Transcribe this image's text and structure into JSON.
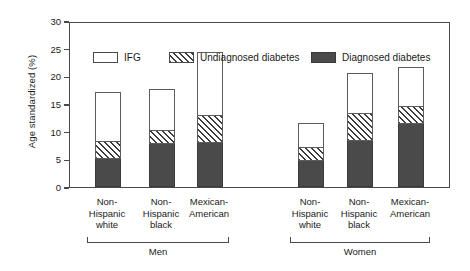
{
  "chart_data": {
    "type": "bar",
    "subtype": "stacked",
    "title": "",
    "xlabel": "",
    "ylabel": "Age standardized (%)",
    "ylim": [
      0,
      30
    ],
    "yticks": [
      0,
      5,
      10,
      15,
      20,
      25,
      30
    ],
    "ytick_labels": [
      "0",
      "5",
      "10",
      "15",
      "20",
      "25",
      "30"
    ],
    "grid": false,
    "legend_position": "top-inside",
    "categories": [
      "Non-\nHispanic\nwhite",
      "Non-\nHispanic\nblack",
      "Mexican-\nAmerican",
      "Non-\nHispanic\nwhite",
      "Non-\nHispanic\nblack",
      "Mexican-\nAmerican"
    ],
    "category_lines": [
      [
        "Non-",
        "Hispanic",
        "white"
      ],
      [
        "Non-",
        "Hispanic",
        "black"
      ],
      [
        "Mexican-",
        "American"
      ],
      [
        "Non-",
        "Hispanic",
        "white"
      ],
      [
        "Non-",
        "Hispanic",
        "black"
      ],
      [
        "Mexican-",
        "American"
      ]
    ],
    "groups": [
      {
        "label": "Men",
        "categories": [
          0,
          1,
          2
        ]
      },
      {
        "label": "Women",
        "categories": [
          3,
          4,
          5
        ]
      }
    ],
    "series": [
      {
        "name": "Diagnosed diabetes",
        "fill": "solid-dark",
        "color": "#4a4a4a",
        "values": [
          5.0,
          7.8,
          8.0,
          4.7,
          8.4,
          11.3
        ]
      },
      {
        "name": "Undiagnosed diabetes",
        "fill": "hatched",
        "color": "#ffffff",
        "values": [
          3.2,
          2.4,
          4.8,
          2.3,
          4.8,
          3.2
        ]
      },
      {
        "name": "IFG",
        "fill": "white",
        "color": "#ffffff",
        "values": [
          8.8,
          7.4,
          11.4,
          4.4,
          7.2,
          7.0
        ]
      }
    ],
    "cumulative_tops": [
      [
        5.0,
        8.2,
        17.0
      ],
      [
        7.8,
        10.2,
        17.6
      ],
      [
        8.0,
        12.8,
        24.2
      ],
      [
        4.7,
        7.0,
        11.4
      ],
      [
        8.4,
        13.2,
        20.4
      ],
      [
        11.3,
        14.5,
        21.5
      ]
    ],
    "totals": [
      17.0,
      17.6,
      24.2,
      11.4,
      20.4,
      21.5
    ]
  },
  "legend": {
    "items": [
      {
        "label": "IFG",
        "swatch": "ifg"
      },
      {
        "label": "Undiagnosed diabetes",
        "swatch": "undiag"
      },
      {
        "label": "Diagnosed diabetes",
        "swatch": "diag"
      }
    ]
  },
  "colors": {
    "diagnosed": "#4a4a4a",
    "undiagnosed_hatch": "#3c3c3c",
    "ifg": "#ffffff",
    "axis": "#4a4a4a",
    "background": "#ffffff"
  }
}
